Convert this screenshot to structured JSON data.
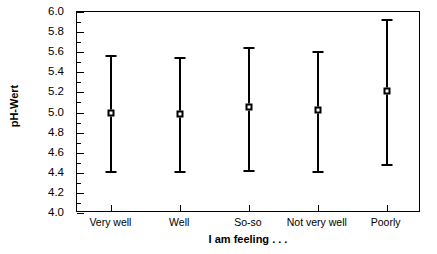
{
  "chart_data": {
    "type": "scatter",
    "title": "",
    "xlabel": "I am feeling . . .",
    "ylabel": "pH-Wert",
    "categories": [
      "Very well",
      "Well",
      "So-so",
      "Not very well",
      "Poorly"
    ],
    "values": [
      5.0,
      4.99,
      5.05,
      5.02,
      5.21
    ],
    "error_low": [
      4.42,
      4.42,
      4.43,
      4.42,
      4.49
    ],
    "error_high": [
      5.57,
      5.55,
      5.65,
      5.61,
      5.93
    ],
    "series": [
      {
        "name": "pH-Wert",
        "marker": "open-square",
        "values": [
          5.0,
          4.99,
          5.05,
          5.02,
          5.21
        ],
        "error_low": [
          4.42,
          4.42,
          4.43,
          4.42,
          4.49
        ],
        "error_high": [
          5.57,
          5.55,
          5.65,
          5.61,
          5.93
        ]
      }
    ],
    "points": [
      {
        "category": "Very well",
        "mean": 5.0,
        "low": 4.42,
        "high": 5.57
      },
      {
        "category": "Well",
        "mean": 4.99,
        "low": 4.42,
        "high": 5.55
      },
      {
        "category": "So-so",
        "mean": 5.05,
        "low": 4.43,
        "high": 5.65
      },
      {
        "category": "Not very well",
        "mean": 5.02,
        "low": 4.42,
        "high": 5.61
      },
      {
        "category": "Poorly",
        "mean": 5.21,
        "low": 4.49,
        "high": 5.93
      }
    ],
    "ylim": [
      4.0,
      6.0
    ],
    "ytick_step": 0.2,
    "ytick_labels": [
      "6.0",
      "5.8",
      "5.6",
      "5.4",
      "5.2",
      "5.0",
      "4.8",
      "4.6",
      "4.4",
      "4.2",
      "4.0"
    ],
    "ytick_values": [
      6.0,
      5.8,
      5.6,
      5.4,
      5.2,
      5.0,
      4.8,
      4.6,
      4.4,
      4.2,
      4.0
    ],
    "grid": false,
    "legend": null,
    "legend_position": "none",
    "colors": {
      "axis": "#000000",
      "marker_fill": "#ffffff",
      "marker_edge": "#000000",
      "background": "#ffffff"
    }
  }
}
